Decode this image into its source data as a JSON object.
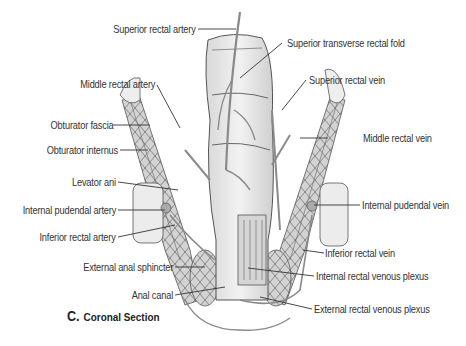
{
  "figure": {
    "caption_letter": "C.",
    "caption_text": "Coronal Section",
    "labels_left": [
      {
        "id": "superior-rectal-artery",
        "text": "Superior rectal artery"
      },
      {
        "id": "middle-rectal-artery",
        "text": "Middle rectal artery"
      },
      {
        "id": "obturator-fascia",
        "text": "Obturator fascia"
      },
      {
        "id": "obturator-internus",
        "text": "Obturator internus"
      },
      {
        "id": "levator-ani",
        "text": "Levator ani"
      },
      {
        "id": "internal-pudendal-artery",
        "text": "Internal pudendal artery"
      },
      {
        "id": "inferior-rectal-artery",
        "text": "Inferior rectal artery"
      },
      {
        "id": "external-anal-sphincter",
        "text": "External anal sphincter"
      },
      {
        "id": "anal-canal",
        "text": "Anal canal"
      }
    ],
    "labels_right": [
      {
        "id": "superior-transverse-rectal-fold",
        "text": "Superior transverse rectal fold"
      },
      {
        "id": "superior-rectal-vein",
        "text": "Superior rectal vein"
      },
      {
        "id": "middle-rectal-vein",
        "text": "Middle rectal vein"
      },
      {
        "id": "internal-pudendal-vein",
        "text": "Internal pudendal vein"
      },
      {
        "id": "inferior-rectal-vein",
        "text": "Inferior rectal vein"
      },
      {
        "id": "internal-rectal-venous-plexus",
        "text": "Internal rectal venous plexus"
      },
      {
        "id": "external-rectal-venous-plexus",
        "text": "External rectal venous plexus"
      }
    ],
    "colors": {
      "tissue": "#e6e6e6",
      "tissue_dark": "#bdbdbd",
      "vessel": "#8a8a8a",
      "outline": "#555555",
      "line": "#333333"
    }
  }
}
